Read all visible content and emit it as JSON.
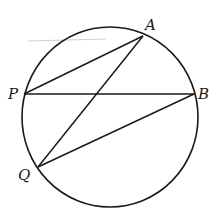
{
  "figure": {
    "type": "circle-geometry",
    "circle": {
      "cx": 110,
      "cy": 117,
      "rx": 88,
      "ry": 90,
      "stroke": "#1a1a1a"
    },
    "points": {
      "A": {
        "label": "A",
        "x": 143,
        "y": 36,
        "lx": 145,
        "ly": 30
      },
      "P": {
        "label": "P",
        "x": 24,
        "y": 94,
        "lx": 8,
        "ly": 99
      },
      "B": {
        "label": "B",
        "x": 194,
        "y": 94,
        "lx": 198,
        "ly": 99
      },
      "Q": {
        "label": "Q",
        "x": 38,
        "y": 167,
        "lx": 18,
        "ly": 180
      }
    },
    "segments": [
      {
        "name": "PA",
        "from": "P",
        "to": "A"
      },
      {
        "name": "PB",
        "from": "P",
        "to": "B"
      },
      {
        "name": "AQ",
        "from": "A",
        "to": "Q"
      },
      {
        "name": "QB",
        "from": "Q",
        "to": "B"
      }
    ],
    "stray_mark": {
      "x1": 28,
      "y1": 41,
      "x2": 106,
      "y2": 39,
      "color": "#c8c8c8"
    }
  }
}
